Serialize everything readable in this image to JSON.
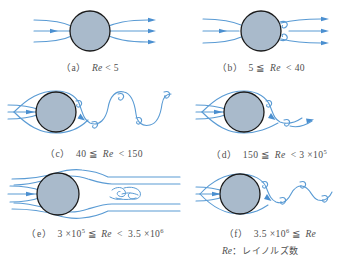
{
  "figure": {
    "colors": {
      "background": "#ffffff",
      "streamline": "#5a9bd4",
      "streamline_light": "#9cc3e5",
      "cylinder_fill": "#a9bacb",
      "cylinder_stroke": "#1a1a1a",
      "caption_text": "#4f4f4f"
    }
  },
  "panels": [
    {
      "id": "a",
      "label": "（a）",
      "condition_prefix": "",
      "re_symbol": "Re",
      "relation_left": "",
      "relation_right": "< 5",
      "caption_plain": "（a） Re < 5",
      "regime": "creeping-attached-flow",
      "vortex_count": 0
    },
    {
      "id": "b",
      "label": "（b）",
      "condition_prefix": "5 ≦",
      "re_symbol": "Re",
      "relation_left": "5 ≦",
      "relation_right": "< 40",
      "caption_plain": "（b） 5 ≦ Re < 40",
      "regime": "steady-attached-vortex-pair",
      "vortex_count": 2
    },
    {
      "id": "c",
      "label": "（c）",
      "condition_prefix": "40 ≦",
      "re_symbol": "Re",
      "relation_left": "40 ≦",
      "relation_right": "< 150",
      "caption_plain": "（c） 40 ≦ Re < 150",
      "regime": "laminar-karman-vortex-street",
      "vortex_count": 5
    },
    {
      "id": "d",
      "label": "（d）",
      "condition_prefix": "150 ≦",
      "re_symbol": "Re",
      "relation_left": "150 ≦",
      "relation_right_mantissa": "< 3 ×",
      "relation_right_base": "10",
      "relation_right_exp": "5",
      "caption_plain": "（d） 150 ≦ Re < 3 × 10^5",
      "regime": "transition-turbulent-wake",
      "vortex_count": 2
    },
    {
      "id": "e",
      "label": "（e）",
      "left_mantissa": "3 ×",
      "left_base": "10",
      "left_exp": "5",
      "left_relation": "≦",
      "re_symbol": "Re",
      "right_relation": "<",
      "right_mantissa": "3.5 ×",
      "right_base": "10",
      "right_exp": "6",
      "caption_plain": "（e） 3 × 10^5 ≦ Re < 3.5 × 10^6",
      "regime": "critical-narrow-turbulent-wake",
      "vortex_count": 0
    },
    {
      "id": "f",
      "label": "（f）",
      "left_mantissa": "3.5 ×",
      "left_base": "10",
      "left_exp": "6",
      "left_relation": "≦",
      "re_symbol": "Re",
      "caption_plain": "（f） 3.5 × 10^6 ≦ Re",
      "regime": "supercritical-turbulent-vortex-shedding",
      "vortex_count": 4
    }
  ],
  "legend": {
    "symbol": "Re",
    "separator": "：",
    "definition": "レイノルズ数",
    "plain": "Re：レイノルズ数"
  }
}
